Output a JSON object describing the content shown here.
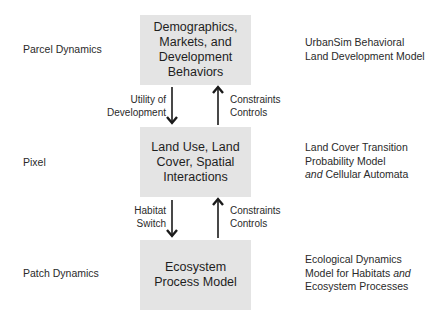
{
  "scale_labels": {
    "top": "Parcel Dynamics",
    "middle": "Pixel",
    "bottom": "Patch Dynamics"
  },
  "boxes": {
    "top": "Demographics,\nMarkets, and\nDevelopment\nBehaviors",
    "middle": "Land Use, Land\nCover, Spatial\nInteractions",
    "bottom": "Ecosystem\nProcess Model"
  },
  "models": {
    "top": {
      "line1": "UrbanSim Behavioral",
      "line2": "Land Development Model"
    },
    "middle": {
      "line1": "Land Cover Transition",
      "line2": "Probability Model",
      "line3_italic": "and",
      "line3_rest": " Cellular Automata"
    },
    "bottom": {
      "line1": "Ecological Dynamics",
      "line2_rest": "Model for Habitats ",
      "line2_italic": "and",
      "line3": "Ecosystem Processes"
    }
  },
  "edges": {
    "top_down": "Utility of\nDevelopment",
    "top_up": "Constraints\nControls",
    "bottom_down": "Habitat\nSwitch",
    "bottom_up": "Constraints\nControls"
  },
  "colors": {
    "box_fill": "#e4e4e4",
    "arrow": "#1a1a1a",
    "text": "#2a2a2a"
  }
}
